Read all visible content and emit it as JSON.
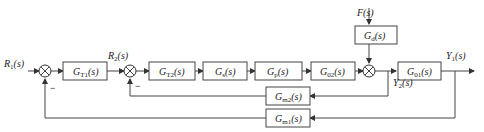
{
  "diagram": {
    "type": "block-diagram",
    "signals": {
      "r1": {
        "main": "R",
        "sub": "1",
        "arg": "(s)"
      },
      "r2": {
        "main": "R",
        "sub": "2",
        "arg": "(s)"
      },
      "f": {
        "main": "F",
        "sub": "",
        "arg": "(s)"
      },
      "y1": {
        "main": "Y",
        "sub": "1",
        "arg": "(s)"
      },
      "y2": {
        "main": "Y",
        "sub": "2",
        "arg": "(s)"
      }
    },
    "blocks": {
      "gt1": {
        "main": "G",
        "sub": "T1",
        "arg": "(s)"
      },
      "gt2": {
        "main": "G",
        "sub": "T2",
        "arg": "(s)"
      },
      "gs": {
        "main": "G",
        "sub": "s",
        "arg": "(s)"
      },
      "gp": {
        "main": "G",
        "sub": "p",
        "arg": "(s)"
      },
      "g02": {
        "main": "G",
        "sub": "02",
        "arg": "(s)"
      },
      "gd": {
        "main": "G",
        "sub": "d",
        "arg": "(s)"
      },
      "g01": {
        "main": "G",
        "sub": "01",
        "arg": "(s)"
      },
      "gm2": {
        "main": "G",
        "sub": "m2",
        "arg": "(s)"
      },
      "gm1": {
        "main": "G",
        "sub": "m1",
        "arg": "(s)"
      }
    },
    "signs": {
      "sum1_feedback": "−",
      "sum2_feedback": "−"
    }
  }
}
